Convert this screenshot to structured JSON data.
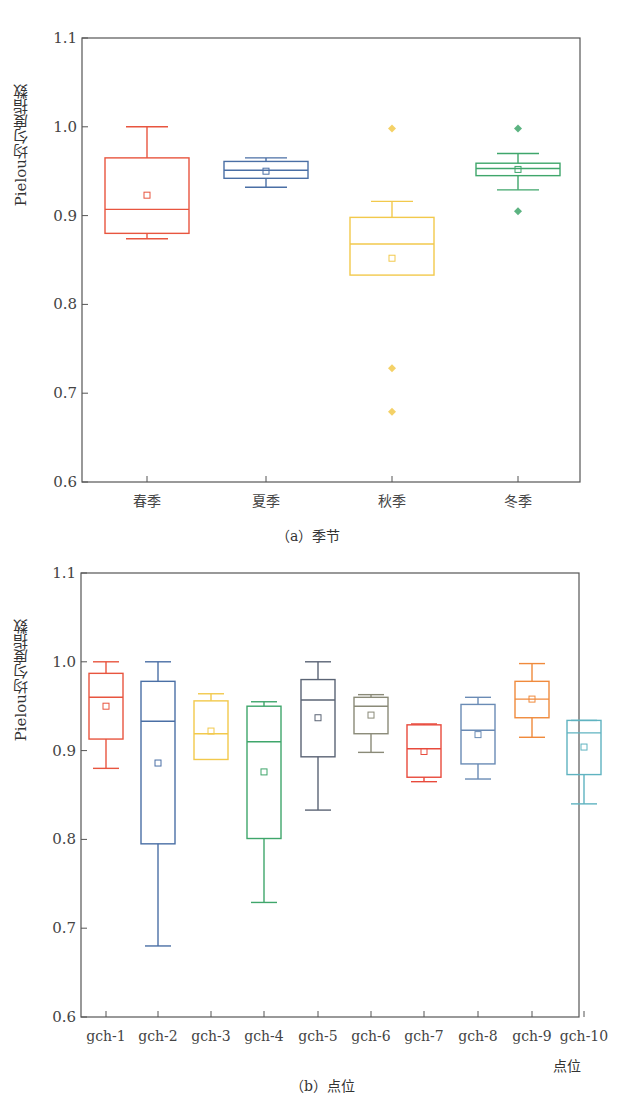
{
  "chart_data": [
    {
      "type": "box",
      "panel": "a",
      "caption": "（a）季节",
      "title": "",
      "xlabel": "",
      "ylabel": "Pielou均匀度指数",
      "ylim": [
        0.6,
        1.1
      ],
      "yticks": [
        "0.6",
        "0.7",
        "0.8",
        "0.9",
        "1.0",
        "1.1"
      ],
      "grid": false,
      "categories": [
        "春季",
        "夏季",
        "秋季",
        "冬季"
      ],
      "series": [
        {
          "name": "春季",
          "color": "#e8553f",
          "whisker_high": 1.0,
          "q3": 0.965,
          "median": 0.907,
          "q1": 0.88,
          "whisker_low": 0.874,
          "mean": 0.923,
          "outliers": []
        },
        {
          "name": "夏季",
          "color": "#4a6fa5",
          "whisker_high": 0.965,
          "q3": 0.961,
          "median": 0.951,
          "q1": 0.942,
          "whisker_low": 0.932,
          "mean": 0.95,
          "outliers": []
        },
        {
          "name": "秋季",
          "color": "#f2c94c",
          "whisker_high": 0.916,
          "q3": 0.898,
          "median": 0.868,
          "q1": 0.833,
          "whisker_low": 0.833,
          "mean": 0.852,
          "outliers": [
            0.998,
            0.728,
            0.679
          ]
        },
        {
          "name": "冬季",
          "color": "#3fa66b",
          "whisker_high": 0.97,
          "q3": 0.959,
          "median": 0.953,
          "q1": 0.945,
          "whisker_low": 0.929,
          "mean": 0.952,
          "outliers": [
            0.998,
            0.905
          ]
        }
      ]
    },
    {
      "type": "box",
      "panel": "b",
      "caption": "（b）点位",
      "title": "",
      "xlabel": "点位",
      "ylabel": "Pielou均匀度指数",
      "ylim": [
        0.6,
        1.1
      ],
      "yticks": [
        "0.6",
        "0.7",
        "0.8",
        "0.9",
        "1.0",
        "1.1"
      ],
      "grid": false,
      "categories": [
        "gch-1",
        "gch-2",
        "gch-3",
        "gch-4",
        "gch-5",
        "gch-6",
        "gch-7",
        "gch-8",
        "gch-9",
        "gch-10"
      ],
      "series": [
        {
          "name": "gch-1",
          "color": "#e8553f",
          "whisker_high": 1.0,
          "q3": 0.987,
          "median": 0.96,
          "q1": 0.913,
          "whisker_low": 0.88,
          "mean": 0.95,
          "outliers": []
        },
        {
          "name": "gch-2",
          "color": "#4a6fa5",
          "whisker_high": 1.0,
          "q3": 0.978,
          "median": 0.933,
          "q1": 0.795,
          "whisker_low": 0.68,
          "mean": 0.886,
          "outliers": []
        },
        {
          "name": "gch-3",
          "color": "#f2c94c",
          "whisker_high": 0.964,
          "q3": 0.956,
          "median": 0.919,
          "q1": 0.89,
          "whisker_low": 0.89,
          "mean": 0.922,
          "outliers": []
        },
        {
          "name": "gch-4",
          "color": "#3fa66b",
          "whisker_high": 0.955,
          "q3": 0.95,
          "median": 0.91,
          "q1": 0.801,
          "whisker_low": 0.729,
          "mean": 0.876,
          "outliers": []
        },
        {
          "name": "gch-5",
          "color": "#5b6475",
          "whisker_high": 1.0,
          "q3": 0.98,
          "median": 0.957,
          "q1": 0.893,
          "whisker_low": 0.833,
          "mean": 0.937,
          "outliers": []
        },
        {
          "name": "gch-6",
          "color": "#8a8a78",
          "whisker_high": 0.963,
          "q3": 0.96,
          "median": 0.95,
          "q1": 0.919,
          "whisker_low": 0.898,
          "mean": 0.94,
          "outliers": []
        },
        {
          "name": "gch-7",
          "color": "#e84a3c",
          "whisker_high": 0.93,
          "q3": 0.929,
          "median": 0.902,
          "q1": 0.87,
          "whisker_low": 0.865,
          "mean": 0.899,
          "outliers": []
        },
        {
          "name": "gch-8",
          "color": "#6a8bb5",
          "whisker_high": 0.96,
          "q3": 0.952,
          "median": 0.923,
          "q1": 0.885,
          "whisker_low": 0.868,
          "mean": 0.918,
          "outliers": []
        },
        {
          "name": "gch-9",
          "color": "#f08a3c",
          "whisker_high": 0.998,
          "q3": 0.978,
          "median": 0.958,
          "q1": 0.937,
          "whisker_low": 0.915,
          "mean": 0.958,
          "outliers": []
        },
        {
          "name": "gch-10",
          "color": "#5fb3c0",
          "whisker_high": 0.934,
          "q3": 0.934,
          "median": 0.92,
          "q1": 0.873,
          "whisker_low": 0.84,
          "mean": 0.904,
          "outliers": []
        }
      ]
    }
  ]
}
